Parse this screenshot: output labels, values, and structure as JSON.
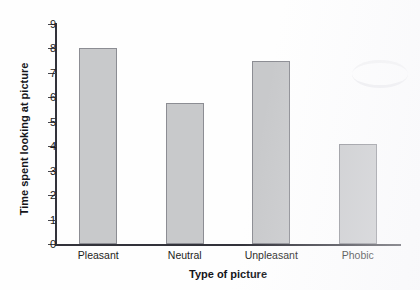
{
  "chart_data": {
    "type": "bar",
    "title": "",
    "xlabel": "Type of picture",
    "ylabel": "Time spent looking at picture",
    "categories": [
      "Pleasant",
      "Neutral",
      "Unpleasant",
      "Phobic"
    ],
    "values": [
      8.0,
      5.75,
      7.5,
      4.1
    ],
    "ylim": [
      0,
      9
    ],
    "yticks": [
      0,
      1,
      2,
      3,
      4,
      5,
      6,
      7,
      8,
      9
    ],
    "ytick_labels": [
      "0",
      "1",
      "2",
      "3",
      "4",
      "5",
      "6",
      "7",
      "8",
      "9"
    ],
    "grid": false,
    "legend": null,
    "bar_fill_color": "#c8c9cb",
    "bar_edge_color": "#8c8d93",
    "axis_color": "#32323a"
  }
}
